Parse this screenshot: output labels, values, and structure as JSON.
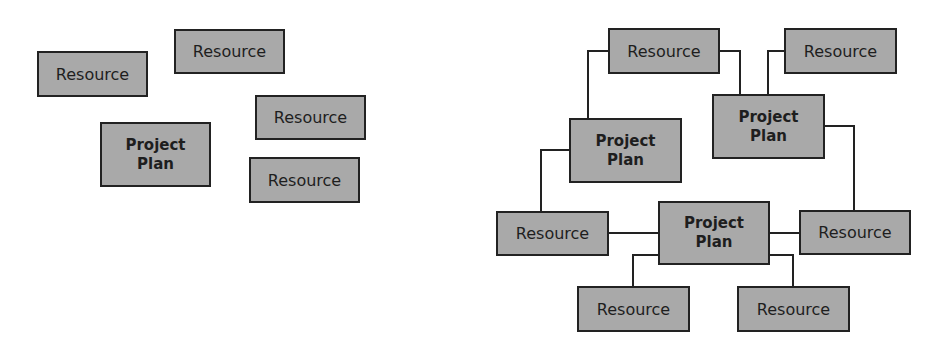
{
  "diagram": {
    "left_panel": {
      "description": "Unconnected resources and project plan",
      "nodes": [
        {
          "id": "L-r1",
          "type": "resource",
          "label": "Resource",
          "x": 37,
          "y": 51,
          "w": 111,
          "h": 46
        },
        {
          "id": "L-r2",
          "type": "resource",
          "label": "Resource",
          "x": 174,
          "y": 29,
          "w": 111,
          "h": 45
        },
        {
          "id": "L-r3",
          "type": "resource",
          "label": "Resource",
          "x": 255,
          "y": 95,
          "w": 111,
          "h": 45
        },
        {
          "id": "L-pp",
          "type": "project",
          "label": "Project\nPlan",
          "x": 100,
          "y": 122,
          "w": 111,
          "h": 65
        },
        {
          "id": "L-r4",
          "type": "resource",
          "label": "Resource",
          "x": 249,
          "y": 157,
          "w": 111,
          "h": 46
        }
      ],
      "edges": []
    },
    "right_panel": {
      "description": "Resources shared among multiple project plans",
      "nodes": [
        {
          "id": "R-r1",
          "type": "resource",
          "label": "Resource",
          "x": 608,
          "y": 28,
          "w": 112,
          "h": 46
        },
        {
          "id": "R-r2",
          "type": "resource",
          "label": "Resource",
          "x": 784,
          "y": 28,
          "w": 113,
          "h": 46
        },
        {
          "id": "R-pp1",
          "type": "project",
          "label": "Project\nPlan",
          "x": 569,
          "y": 118,
          "w": 113,
          "h": 65
        },
        {
          "id": "R-pp2",
          "type": "project",
          "label": "Project\nPlan",
          "x": 712,
          "y": 94,
          "w": 113,
          "h": 65
        },
        {
          "id": "R-r3",
          "type": "resource",
          "label": "Resource",
          "x": 496,
          "y": 211,
          "w": 113,
          "h": 45
        },
        {
          "id": "R-pp3",
          "type": "project",
          "label": "Project\nPlan",
          "x": 658,
          "y": 201,
          "w": 112,
          "h": 64
        },
        {
          "id": "R-r4",
          "type": "resource",
          "label": "Resource",
          "x": 799,
          "y": 210,
          "w": 112,
          "h": 45
        },
        {
          "id": "R-r5",
          "type": "resource",
          "label": "Resource",
          "x": 577,
          "y": 286,
          "w": 113,
          "h": 46
        },
        {
          "id": "R-r6",
          "type": "resource",
          "label": "Resource",
          "x": 737,
          "y": 286,
          "w": 113,
          "h": 46
        }
      ],
      "edges": [
        {
          "from": "R-r1",
          "to": "R-pp1",
          "points": "608,51 588,51 588,118"
        },
        {
          "from": "R-r1",
          "to": "R-pp2",
          "points": "720,51 740,51 740,94"
        },
        {
          "from": "R-r2",
          "to": "R-pp2",
          "points": "784,51 768,51 768,94"
        },
        {
          "from": "R-pp1",
          "to": "R-r3",
          "points": "569,150 541,150 541,211"
        },
        {
          "from": "R-pp2",
          "to": "R-r4",
          "points": "825,126 854,126 854,210"
        },
        {
          "from": "R-r3",
          "to": "R-pp3",
          "points": "609,233 658,233"
        },
        {
          "from": "R-pp3",
          "to": "R-r4",
          "points": "770,233 799,233"
        },
        {
          "from": "R-pp3",
          "to": "R-r5",
          "points": "658,255 633,255 633,286"
        },
        {
          "from": "R-pp3",
          "to": "R-r6",
          "points": "770,255 793,255 793,286"
        }
      ]
    },
    "colors": {
      "box_fill": "#a9a9a9",
      "box_border": "#222222",
      "line": "#222222",
      "text": "#1e1e1e"
    }
  }
}
